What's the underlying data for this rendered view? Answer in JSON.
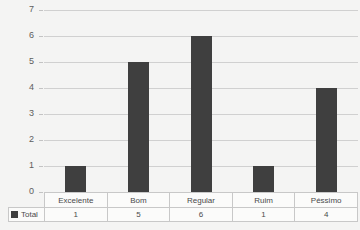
{
  "chart_data": {
    "type": "bar",
    "title": "",
    "xlabel": "",
    "ylabel": "",
    "categories": [
      "Excelente",
      "Bom",
      "Regular",
      "Ruim",
      "Péssimo"
    ],
    "values": [
      1,
      5,
      6,
      1,
      4
    ],
    "series": [
      {
        "name": "Total",
        "values": [
          1,
          5,
          6,
          1,
          4
        ]
      }
    ],
    "ylim": [
      0,
      7
    ],
    "yticks": [
      0,
      1,
      2,
      3,
      4,
      5,
      6,
      7
    ],
    "ytick_labels": [
      "0",
      "1",
      "2",
      "3",
      "4",
      "5",
      "6",
      "7"
    ],
    "grid": true,
    "legend_position": "bottom-left",
    "bar_color": "#3f3f3f",
    "grid_color": "#d0d0d0",
    "background_color": "#f4f4f3"
  },
  "table": {
    "legend_label": "Total",
    "header_row": [
      "Excelente",
      "Bom",
      "Regular",
      "Ruim",
      "Péssimo"
    ],
    "value_row": [
      "1",
      "5",
      "6",
      "1",
      "4"
    ]
  }
}
